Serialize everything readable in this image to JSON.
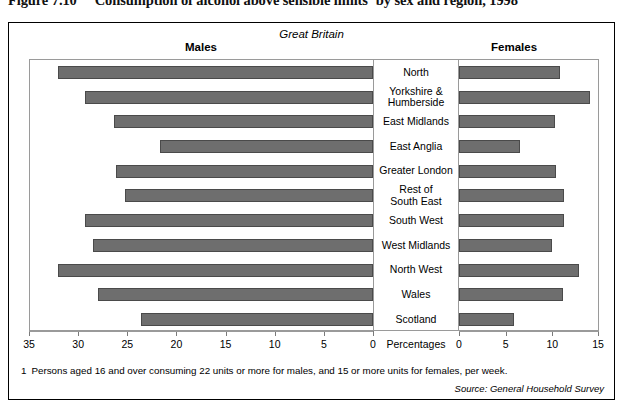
{
  "title": {
    "figure_number": "Figure 7.10",
    "text": "Consumption of alcohol above sensible limits",
    "footnote_marker": "1",
    "text_tail": " by sex and region, 1998"
  },
  "header": {
    "region_scope": "Great Britain",
    "left_series": "Males",
    "right_series": "Females"
  },
  "axis": {
    "center_label": "Percentages",
    "left_ticks": [
      "35",
      "30",
      "25",
      "20",
      "15",
      "10",
      "5",
      "0"
    ],
    "right_ticks": [
      "0",
      "5",
      "10",
      "15"
    ]
  },
  "footnote": {
    "marker": "1",
    "text": "Persons aged 16 and over consuming 22 units or more for males, and 15 or more units for females, per week."
  },
  "source": "Source: General Household Survey",
  "colors": {
    "bar_fill": "#6e6e6e",
    "bar_stroke": "#4a4a4a",
    "frame": "#000000",
    "panel_border": "#9a9a9a"
  },
  "chart_data": {
    "type": "bar",
    "orientation": "horizontal",
    "layout": "back-to-back population pyramid",
    "subtitle": "Great Britain",
    "xlabel": "Percentages",
    "ylabel": "",
    "grid": false,
    "legend_position": "top (Males left, Females right)",
    "left_axis_range": [
      35,
      0
    ],
    "right_axis_range": [
      0,
      15
    ],
    "left_axis_direction": "reversed",
    "categories": [
      "North",
      "Yorkshire & Humberside",
      "East Midlands",
      "East Anglia",
      "Greater London",
      "Rest of South East",
      "South West",
      "West Midlands",
      "North West",
      "Wales",
      "Scotland"
    ],
    "series": [
      {
        "name": "Males",
        "side": "left",
        "values": [
          32.1,
          29.3,
          26.4,
          21.7,
          26.1,
          25.2,
          29.3,
          28.5,
          32.1,
          28.0,
          23.6
        ]
      },
      {
        "name": "Females",
        "side": "right",
        "values": [
          10.8,
          14.0,
          10.3,
          6.5,
          10.4,
          11.3,
          11.3,
          10.0,
          12.9,
          11.1,
          5.9
        ]
      }
    ]
  }
}
